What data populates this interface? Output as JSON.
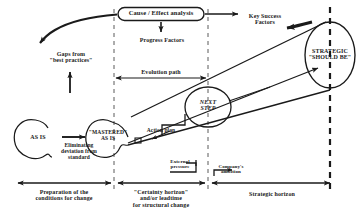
{
  "diagram": {
    "title_box": {
      "label": "Cause / Effect  analysis"
    },
    "progress_factors": {
      "label": "Progress  Factors"
    },
    "key_success_factors": {
      "label": "Key  Success\nFactors"
    },
    "gaps": {
      "label": "Gaps from\n\"best  practices\""
    },
    "evolution_path": {
      "label": "Evolution  path"
    },
    "nodes": {
      "as_is": {
        "label": "AS  IS"
      },
      "mastered_as_is": {
        "label": "\"MASTERED\"\nAS  IS"
      },
      "next_step": {
        "label": "NEXT\nSTEP"
      },
      "strategic_should_be": {
        "label": "STRATEGIC\n\"SHOULD BE\""
      }
    },
    "transitions": {
      "eliminating": {
        "label": "Eliminating\ndeviation from\nstandard"
      },
      "action_plan": {
        "label": "Action  plan"
      }
    },
    "forces": {
      "external_pressure": {
        "label": "External\npressure"
      },
      "company_ambition": {
        "label": "Company's\nambition"
      }
    },
    "horizons": [
      {
        "label": "Preparation of the\nconditions for  change"
      },
      {
        "label": "\"Certainty  horizon\"\nand/or  leadtime\nfor  structural  change"
      },
      {
        "label": "Strategic  horizon"
      }
    ],
    "colors": {
      "ink": "#1a1a1a",
      "line": "#222222",
      "dash": "#444444",
      "background": "#ffffff"
    }
  }
}
